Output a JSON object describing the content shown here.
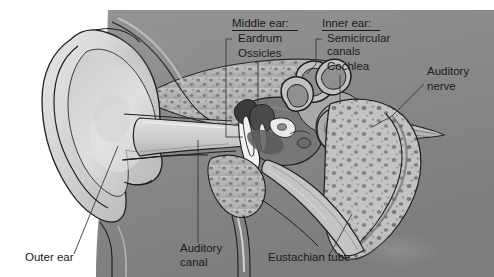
{
  "figure": {
    "background_color": "#ffffff",
    "text_color": "#1a1a1a",
    "leader_color": "#3a3a3a"
  },
  "palette": {
    "pinna_light": "#d9d9d9",
    "pinna_mid": "#c2c2c2",
    "tissue_dark": "#8d8d8d",
    "bone_fill": "#b9b9b9",
    "bone_speckle": "#6f6f6f",
    "canal_light": "#cfcfcf",
    "cochlea_mid": "#9a9a9a",
    "ossicle_dark": "#3c3c3c",
    "ossicle_light": "#ededed",
    "outline": "#1f1f1f"
  },
  "headings": [
    {
      "id": "middle-ear",
      "text": "Middle ear:",
      "x": 232,
      "y": 27,
      "underline_x2": 298
    },
    {
      "id": "inner-ear",
      "text": "Inner ear:",
      "x": 322,
      "y": 27,
      "underline_x2": 380
    }
  ],
  "labels": [
    {
      "id": "eardrum",
      "text": "Eardrum",
      "x": 238,
      "y": 42,
      "anchor": "start"
    },
    {
      "id": "ossicles",
      "text": "Ossicles",
      "x": 238,
      "y": 57,
      "anchor": "start"
    },
    {
      "id": "semicircular-canals-line1",
      "text": "Semicircular",
      "x": 327,
      "y": 42,
      "anchor": "start"
    },
    {
      "id": "semicircular-canals-line2",
      "text": "canals",
      "x": 327,
      "y": 55,
      "anchor": "start"
    },
    {
      "id": "cochlea",
      "text": "Cochlea",
      "x": 327,
      "y": 70,
      "anchor": "start"
    },
    {
      "id": "auditory-nerve-line1",
      "text": "Auditory",
      "x": 427,
      "y": 75,
      "anchor": "start"
    },
    {
      "id": "auditory-nerve-line2",
      "text": "nerve",
      "x": 427,
      "y": 90,
      "anchor": "start"
    },
    {
      "id": "outer-ear",
      "text": "Outer ear",
      "x": 25,
      "y": 261,
      "anchor": "start"
    },
    {
      "id": "auditory-canal-line1",
      "text": "Auditory",
      "x": 180,
      "y": 252,
      "anchor": "start"
    },
    {
      "id": "auditory-canal-line2",
      "text": "canal",
      "x": 180,
      "y": 266,
      "anchor": "start"
    },
    {
      "id": "eustachian-tube",
      "text": "Eustachian tube",
      "x": 268,
      "y": 261,
      "anchor": "start"
    }
  ],
  "structures": [
    {
      "id": "pinna",
      "name": "Outer ear (pinna)"
    },
    {
      "id": "auditory-canal",
      "name": "Auditory canal"
    },
    {
      "id": "eardrum",
      "name": "Eardrum (tympanic membrane)"
    },
    {
      "id": "ossicles",
      "name": "Ossicles"
    },
    {
      "id": "semicircular-canals",
      "name": "Semicircular canals"
    },
    {
      "id": "cochlea",
      "name": "Cochlea"
    },
    {
      "id": "auditory-nerve",
      "name": "Auditory nerve"
    },
    {
      "id": "eustachian-tube",
      "name": "Eustachian tube"
    },
    {
      "id": "temporal-bone",
      "name": "Temporal bone"
    },
    {
      "id": "mastoid-bone",
      "name": "Mastoid bone"
    }
  ]
}
